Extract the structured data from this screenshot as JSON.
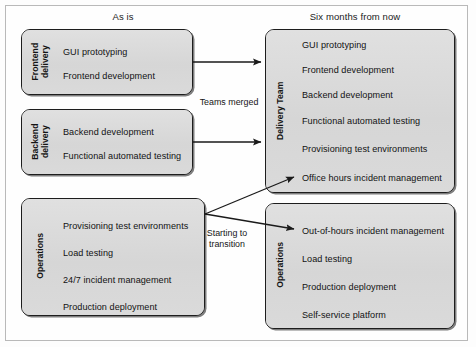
{
  "diagram": {
    "colors": {
      "box_fill": "#dcdcdc",
      "box_border": "#1d1d1d",
      "frame_border": "#b9b9b9",
      "text": "#121212",
      "arrow": "#1a1a1a",
      "background": "#fdfdfd"
    },
    "columns": [
      {
        "id": "as-is",
        "header": "As is"
      },
      {
        "id": "six-months",
        "header": "Six months from now"
      }
    ],
    "boxes": [
      {
        "id": "frontend-delivery",
        "column": "as-is",
        "label_lines": [
          "Frontend",
          "delivery"
        ],
        "label": "Frontend delivery",
        "items": [
          "GUI prototyping",
          "Frontend development"
        ]
      },
      {
        "id": "backend-delivery",
        "column": "as-is",
        "label_lines": [
          "Backend",
          "delivery"
        ],
        "label": "Backend delivery",
        "items": [
          "Backend development",
          "Functional automated testing"
        ]
      },
      {
        "id": "operations-as-is",
        "column": "as-is",
        "label_lines": [
          "Operations"
        ],
        "label": "Operations",
        "items": [
          "Provisioning test environments",
          "Load testing",
          "24/7 incident management",
          "Production deployment"
        ]
      },
      {
        "id": "delivery-team",
        "column": "six-months",
        "label_lines": [
          "Delivery Team"
        ],
        "label": "Delivery Team",
        "items": [
          "GUI prototyping",
          "Frontend development",
          "Backend development",
          "Functional automated testing",
          "Provisioning test environments",
          "Office hours incident management"
        ]
      },
      {
        "id": "operations-future",
        "column": "six-months",
        "label_lines": [
          "Operations"
        ],
        "label": "Operations",
        "items": [
          "Out-of-hours incident management",
          "Load testing",
          "Production deployment",
          "Self-service platform"
        ]
      }
    ],
    "edges": [
      {
        "id": "frontend-to-delivery",
        "from": "frontend-delivery",
        "to": "delivery-team",
        "label": "Teams merged"
      },
      {
        "id": "backend-to-delivery",
        "from": "backend-delivery",
        "to": "delivery-team",
        "label": ""
      },
      {
        "id": "operations-to-delivery",
        "from": "operations-as-is",
        "to": "delivery-team",
        "label": ""
      },
      {
        "id": "operations-to-operations",
        "from": "operations-as-is",
        "to": "operations-future",
        "label": ""
      }
    ],
    "edge_labels": [
      {
        "id": "teams-merged",
        "lines": [
          "Teams merged"
        ]
      },
      {
        "id": "starting-to-transition",
        "lines": [
          "Starting to",
          "transition"
        ]
      }
    ]
  }
}
